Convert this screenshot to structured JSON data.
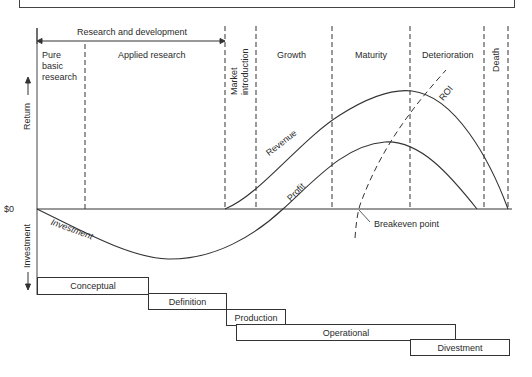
{
  "header": {
    "rd_label": "Research and development"
  },
  "phases": [
    {
      "id": "pure",
      "label": "Pure basic research",
      "lines": [
        "Pure",
        "basic",
        "research"
      ]
    },
    {
      "id": "applied",
      "label": "Applied research"
    },
    {
      "id": "market",
      "label": "Market introduction",
      "lines": [
        "Market",
        "introduction"
      ]
    },
    {
      "id": "growth",
      "label": "Growth"
    },
    {
      "id": "maturity",
      "label": "Maturity"
    },
    {
      "id": "deterioration",
      "label": "Deterioration"
    },
    {
      "id": "death",
      "label": "Death"
    }
  ],
  "axes": {
    "y_up_label": "Return →",
    "y_down_label": "← Investment",
    "zero_label": "$0"
  },
  "curves": {
    "revenue": "Revenue",
    "profit": "Profit",
    "investment": "Investment",
    "roi": "ROI"
  },
  "annotations": {
    "breakeven": "Breakeven point"
  },
  "stages": [
    {
      "label": "Conceptual"
    },
    {
      "label": "Definition"
    },
    {
      "label": "Production"
    },
    {
      "label": "Operational"
    },
    {
      "label": "Divestment"
    }
  ],
  "colors": {
    "line": "#333333",
    "background": "#ffffff"
  }
}
